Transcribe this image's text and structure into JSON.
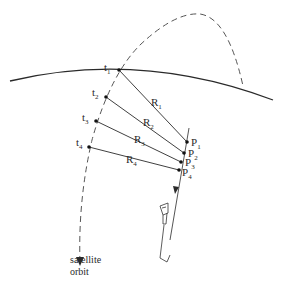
{
  "diagram": {
    "type": "satellite ranging geometry",
    "colors": {
      "line": "#2a2a2a",
      "dashed": "#555555",
      "background": "#ffffff"
    },
    "earth_horizon": {
      "label": ""
    },
    "satellite_orbit": {
      "label_line1": "satellite",
      "label_line2": "orbit"
    },
    "satellite_positions": [
      {
        "label": "t",
        "sub": "1"
      },
      {
        "label": "t",
        "sub": "2"
      },
      {
        "label": "t",
        "sub": "3"
      },
      {
        "label": "t",
        "sub": "4"
      }
    ],
    "ranges": [
      {
        "label": "R",
        "sub": "1"
      },
      {
        "label": "R",
        "sub": "2"
      },
      {
        "label": "R",
        "sub": "3"
      },
      {
        "label": "R",
        "sub": "4"
      }
    ],
    "aircraft_positions": [
      {
        "label": "P",
        "sub": "1"
      },
      {
        "label": "P",
        "sub": "2"
      },
      {
        "label": "P",
        "sub": "3"
      },
      {
        "label": "P",
        "sub": "4"
      }
    ],
    "icons": {
      "aircraft": "aircraft-icon",
      "arrow": "arrowhead-icon"
    }
  }
}
